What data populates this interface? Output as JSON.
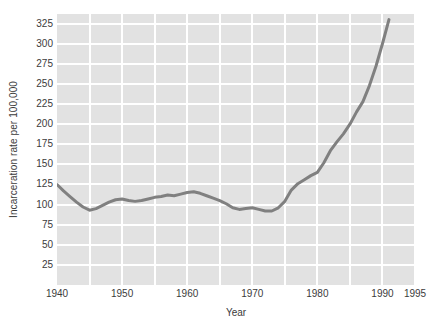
{
  "chart_data": {
    "type": "line",
    "title": "",
    "xlabel": "Year",
    "ylabel": "Incarceration rate per 100,000",
    "xlim": [
      1940,
      1995
    ],
    "ylim": [
      0,
      337
    ],
    "grid": true,
    "legend": null,
    "line_color": "#808080",
    "plot_background": "#e2e2e2",
    "gridline_color": "#ffffff",
    "text_color": "#3b3b3b",
    "y_ticks": [
      25,
      50,
      75,
      100,
      125,
      150,
      175,
      200,
      225,
      250,
      275,
      300,
      325
    ],
    "x_ticks": [
      1940,
      1950,
      1960,
      1970,
      1980,
      1990,
      1995
    ],
    "x_gridlines": [
      1945,
      1950,
      1955,
      1960,
      1965,
      1970,
      1975,
      1980,
      1985,
      1990,
      1995
    ],
    "x": [
      1940,
      1941,
      1942,
      1943,
      1944,
      1945,
      1946,
      1947,
      1948,
      1949,
      1950,
      1951,
      1952,
      1953,
      1954,
      1955,
      1956,
      1957,
      1958,
      1959,
      1960,
      1961,
      1962,
      1963,
      1964,
      1965,
      1966,
      1967,
      1968,
      1969,
      1970,
      1971,
      1972,
      1973,
      1974,
      1975,
      1976,
      1977,
      1978,
      1979,
      1980,
      1981,
      1982,
      1983,
      1984,
      1985,
      1986,
      1987,
      1988,
      1989,
      1990,
      1991
    ],
    "values": [
      125,
      117,
      110,
      103,
      97,
      93,
      95,
      99,
      103,
      106,
      107,
      105,
      104,
      105,
      107,
      109,
      110,
      112,
      111,
      113,
      115,
      116,
      114,
      111,
      108,
      105,
      101,
      96,
      94,
      95,
      96,
      94,
      92,
      92,
      96,
      104,
      118,
      126,
      131,
      136,
      140,
      152,
      167,
      178,
      188,
      200,
      215,
      228,
      248,
      272,
      300,
      330
    ],
    "annotations": []
  },
  "axis": {
    "y_label": "Incarceration rate per 100,000",
    "x_label": "Year",
    "y_tick_labels": [
      "325",
      "300",
      "275",
      "250",
      "225",
      "200",
      "175",
      "150",
      "125",
      "100",
      "75",
      "50",
      "25"
    ],
    "x_tick_labels": [
      "1940",
      "1950",
      "1960",
      "1970",
      "1980",
      "1990",
      "1995"
    ]
  }
}
